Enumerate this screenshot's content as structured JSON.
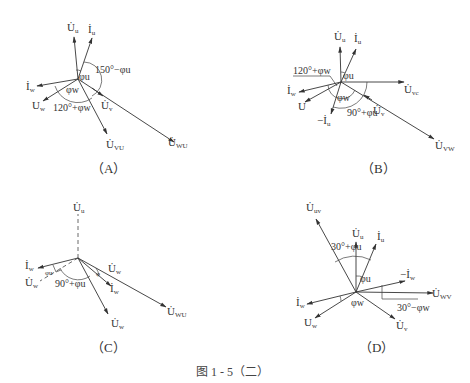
{
  "figure": {
    "caption": "图 1 - 5（二）",
    "panels": [
      {
        "id": "A",
        "label": "（A）",
        "vectors": [
          {
            "name": "U_u",
            "text": "U̇",
            "sub": "u"
          },
          {
            "name": "I_u",
            "text": "İ",
            "sub": "u"
          },
          {
            "name": "I_w",
            "text": "İ",
            "sub": "w"
          },
          {
            "name": "U_w",
            "text": "U",
            "sub": "w"
          },
          {
            "name": "U_vu",
            "text": "U̇",
            "sub": "VU"
          },
          {
            "name": "U_v",
            "text": "U̇",
            "sub": "v"
          },
          {
            "name": "U_wu",
            "text": "U̇",
            "sub": "WU"
          }
        ],
        "angles": {
          "phi_u": "φu",
          "phi_w": "φw",
          "a1": "150°−φu",
          "a2": "120°+φw"
        }
      },
      {
        "id": "B",
        "label": "（B）",
        "vectors": [
          {
            "name": "U_u",
            "text": "U̇",
            "sub": "u"
          },
          {
            "name": "I_u",
            "text": "İ",
            "sub": "u"
          },
          {
            "name": "U_vc",
            "text": "U̇",
            "sub": "vc"
          },
          {
            "name": "U_v",
            "text": "U̇",
            "sub": "v"
          },
          {
            "name": "U_vw",
            "text": "U̇",
            "sub": "VW"
          },
          {
            "name": "I_w",
            "text": "İ",
            "sub": "w"
          },
          {
            "name": "U",
            "text": "U",
            "sub": ""
          },
          {
            "name": "neg_I_u",
            "text": "−İ",
            "sub": "u"
          }
        ],
        "angles": {
          "phi_u": "φu",
          "phi_w": "φw",
          "a1": "120°+φw",
          "a2": "90°+φu"
        }
      },
      {
        "id": "C",
        "label": "（C）",
        "vectors": [
          {
            "name": "U_u",
            "text": "U̇",
            "sub": "u"
          },
          {
            "name": "I_w_left",
            "text": "İ",
            "sub": "w"
          },
          {
            "name": "U_w_dashed",
            "text": "U̇",
            "sub": "w"
          },
          {
            "name": "U_w_upper",
            "text": "U̇",
            "sub": "w"
          },
          {
            "name": "I_w_right",
            "text": "İ",
            "sub": "w"
          },
          {
            "name": "U_w_lower",
            "text": "U̇",
            "sub": "w"
          },
          {
            "name": "U_wu",
            "text": "U̇",
            "sub": "WU"
          }
        ],
        "angles": {
          "phi_u": "φu",
          "phi_small": "φ",
          "a1": "90°+φu"
        }
      },
      {
        "id": "D",
        "label": "（D）",
        "vectors": [
          {
            "name": "U_uv",
            "text": "U̇",
            "sub": "uv"
          },
          {
            "name": "U_u",
            "text": "U̇",
            "sub": "u"
          },
          {
            "name": "I_u",
            "text": "İ",
            "sub": "u"
          },
          {
            "name": "neg_I_w",
            "text": "−İ",
            "sub": "w"
          },
          {
            "name": "U_wv",
            "text": "U̇",
            "sub": "WV"
          },
          {
            "name": "U_v",
            "text": "U̇",
            "sub": "v"
          },
          {
            "name": "I_w",
            "text": "İ",
            "sub": "w"
          },
          {
            "name": "U_w",
            "text": "U",
            "sub": "w"
          }
        ],
        "angles": {
          "phi_u": "φu",
          "phi_w": "φw",
          "a1": "30°+φu",
          "a2": "30°−φw"
        }
      }
    ]
  }
}
